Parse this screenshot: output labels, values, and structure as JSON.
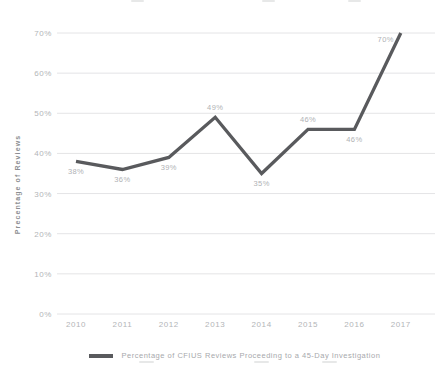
{
  "chart_data": {
    "type": "line",
    "title": "",
    "categories": [
      "2010",
      "2011",
      "2012",
      "2013",
      "2014",
      "2015",
      "2016",
      "2017"
    ],
    "values": [
      38,
      36,
      39,
      49,
      35,
      46,
      46,
      70
    ],
    "point_labels": [
      "38%",
      "36%",
      "39%",
      "49%",
      "35%",
      "46%",
      "46%",
      "70%"
    ],
    "point_label_positions": [
      "below",
      "below",
      "below",
      "above",
      "below",
      "above",
      "below",
      "left"
    ],
    "ylabel": "Precentage of Reviews",
    "xlabel": "",
    "ylim": [
      0,
      70
    ],
    "ytick_step": 10,
    "ytick_labels": [
      "0%",
      "10%",
      "20%",
      "30%",
      "40%",
      "50%",
      "60%",
      "70%"
    ],
    "grid": "horizontal",
    "legend": {
      "position": "bottom-center",
      "label": "Percentage of CFIUS Reviews Proceeding to a 45-Day Investigation"
    },
    "colors": {
      "line": "#595a5d",
      "grid": "#e4e4e6",
      "tick_label": "#b3b5b8",
      "point_label": "#b0b2b5",
      "axis_title": "#8c8e91",
      "legend_text": "#a7a9ac",
      "background": "#ffffff"
    }
  }
}
